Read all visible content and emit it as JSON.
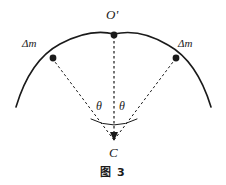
{
  "figure": {
    "caption": "图 3",
    "background_color": "#ffffff",
    "stroke_color": "#1a1a1a",
    "labels": {
      "apex": "O'",
      "mass_left": "Δm",
      "mass_right": "Δm",
      "angle_left": "θ",
      "angle_right": "θ",
      "center": "C"
    },
    "geometry": {
      "center_point": {
        "x": 114,
        "y": 140
      },
      "apex_point": {
        "x": 114,
        "y": 34
      },
      "mass_left_point": {
        "x": 52,
        "y": 58
      },
      "mass_right_point": {
        "x": 176,
        "y": 58
      },
      "arc_left_end": {
        "x": 16,
        "y": 107
      },
      "arc_right_end": {
        "x": 211,
        "y": 107
      },
      "angle_arc_radius": 26
    }
  }
}
